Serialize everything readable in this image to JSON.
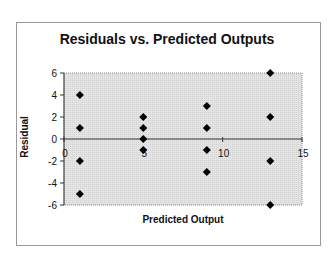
{
  "chart_data": {
    "type": "scatter",
    "title": "Residuals vs. Predicted Outputs",
    "xlabel": "Predicted Output",
    "ylabel": "Residual",
    "xlim": [
      0,
      15
    ],
    "ylim": [
      -6,
      6
    ],
    "x_ticks": [
      0,
      5,
      10,
      15
    ],
    "y_ticks": [
      6,
      4,
      2,
      0,
      -2,
      -4,
      -6
    ],
    "grid": false,
    "legend": null,
    "plot_background": "#e6e6e6",
    "marker": "diamond",
    "marker_color": "#000000",
    "series": [
      {
        "name": "Residuals",
        "points": [
          {
            "x": 1,
            "y": 4
          },
          {
            "x": 1,
            "y": 1
          },
          {
            "x": 1,
            "y": -2
          },
          {
            "x": 1,
            "y": -5
          },
          {
            "x": 5,
            "y": 2
          },
          {
            "x": 5,
            "y": 1
          },
          {
            "x": 5,
            "y": 0
          },
          {
            "x": 5,
            "y": -1
          },
          {
            "x": 9,
            "y": 3
          },
          {
            "x": 9,
            "y": 1
          },
          {
            "x": 9,
            "y": -1
          },
          {
            "x": 9,
            "y": -3
          },
          {
            "x": 13,
            "y": 6
          },
          {
            "x": 13,
            "y": 2
          },
          {
            "x": 13,
            "y": -2
          },
          {
            "x": 13,
            "y": -6
          }
        ]
      }
    ]
  }
}
